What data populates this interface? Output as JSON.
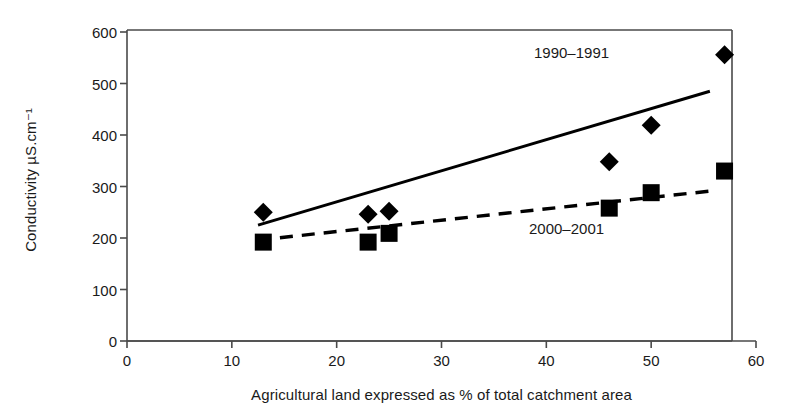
{
  "chart_data": {
    "type": "scatter",
    "title": "",
    "xlabel": "Agricultural land expressed as % of total catchment area",
    "ylabel": "Conductivity µS.cm⁻¹",
    "xlim": [
      0,
      60
    ],
    "ylim": [
      0,
      600
    ],
    "xticks": [
      0,
      10,
      20,
      30,
      40,
      50,
      60
    ],
    "yticks": [
      0,
      100,
      200,
      300,
      400,
      500,
      600
    ],
    "xtick_labels": [
      "0",
      "10",
      "20",
      "30",
      "40",
      "50",
      "60"
    ],
    "ytick_labels": [
      "0",
      "100",
      "200",
      "300",
      "400",
      "500",
      "600"
    ],
    "grid": false,
    "legend_position": "inline-annotation",
    "series": [
      {
        "name": "1990–1991",
        "marker": "diamond",
        "color": "#000000",
        "trendline": "solid",
        "points": [
          {
            "x": 13,
            "y": 250
          },
          {
            "x": 23,
            "y": 246
          },
          {
            "x": 25,
            "y": 252
          },
          {
            "x": 46,
            "y": 348
          },
          {
            "x": 50,
            "y": 419
          },
          {
            "x": 57,
            "y": 556
          }
        ],
        "trendline_points": [
          {
            "x": 12.5,
            "y": 225
          },
          {
            "x": 55.6,
            "y": 485
          }
        ]
      },
      {
        "name": "2000–2001",
        "marker": "square",
        "color": "#000000",
        "trendline": "dashed",
        "points": [
          {
            "x": 13,
            "y": 192
          },
          {
            "x": 23,
            "y": 192
          },
          {
            "x": 25,
            "y": 209
          },
          {
            "x": 46,
            "y": 258
          },
          {
            "x": 50,
            "y": 288
          },
          {
            "x": 57,
            "y": 330
          }
        ],
        "trendline_points": [
          {
            "x": 12.5,
            "y": 196
          },
          {
            "x": 55.6,
            "y": 291
          }
        ]
      }
    ],
    "annotations": [
      {
        "text": "1990–1991",
        "x": 52,
        "y": 525
      },
      {
        "text": "2000–2001",
        "x": 51,
        "y": 190
      }
    ]
  },
  "colors": {
    "axis": "#4a4a4a",
    "marker": "#000000",
    "text": "#1a1a1a",
    "background": "#ffffff"
  }
}
